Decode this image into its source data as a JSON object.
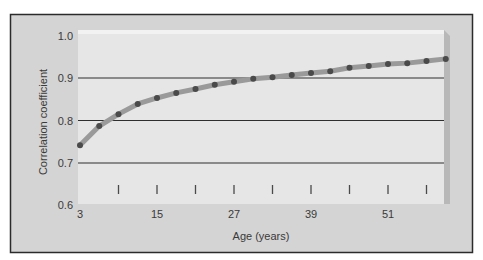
{
  "chart_data": {
    "type": "line",
    "title": "",
    "xlabel": "Age (years)",
    "ylabel": "Correlation coefficient",
    "xlim": [
      3,
      60
    ],
    "ylim": [
      0.6,
      1.0
    ],
    "x_ticks_labeled": [
      3,
      15,
      27,
      39,
      51
    ],
    "x_ticks_minor": [
      9,
      15,
      21,
      27,
      33,
      39,
      45,
      51,
      57
    ],
    "y_ticks": [
      0.6,
      0.7,
      0.8,
      0.9,
      1.0
    ],
    "y_tick_labels": [
      "0.6",
      "0.7",
      "0.8",
      "0.9",
      "1.0"
    ],
    "grid": {
      "horizontal": [
        0.7,
        0.8,
        0.9
      ],
      "vertical": false
    },
    "legend": null,
    "series": [
      {
        "name": "Correlation coefficient",
        "x": [
          3,
          6,
          9,
          12,
          15,
          18,
          21,
          24,
          27,
          30,
          33,
          36,
          39,
          42,
          45,
          48,
          51,
          54,
          57,
          60
        ],
        "values": [
          0.742,
          0.787,
          0.815,
          0.839,
          0.853,
          0.865,
          0.874,
          0.884,
          0.891,
          0.898,
          0.902,
          0.907,
          0.912,
          0.916,
          0.924,
          0.928,
          0.933,
          0.935,
          0.94,
          0.945
        ]
      }
    ]
  },
  "colors": {
    "frame_bg": "#d4d4d4",
    "panel_bg": "#e6e6e6",
    "panel_highlight": "#f2f2f2",
    "panel_shadow": "#b8b8b8",
    "frame_border": "#2b2b2b",
    "gridline": "#2e2e2e",
    "line": "#9a9a9a",
    "marker": "#4a4a4a",
    "text": "#3a3a3a"
  }
}
